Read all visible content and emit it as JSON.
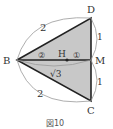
{
  "figure": {
    "caption": "図10",
    "points": {
      "B": {
        "label": "B",
        "x": 17,
        "y": 60
      },
      "D": {
        "label": "D",
        "x": 91,
        "y": 18
      },
      "M": {
        "label": "M",
        "x": 91,
        "y": 60
      },
      "C": {
        "label": "C",
        "x": 91,
        "y": 101
      },
      "H": {
        "label": "H",
        "x": 67,
        "y": 60
      }
    },
    "lengths": {
      "BD": "2",
      "BC": "2",
      "DM": "1",
      "MC": "1",
      "BM": "√3"
    },
    "ratio": {
      "BH": "②",
      "HM": "①"
    },
    "colors": {
      "fill": "#c8c8c8",
      "stroke": "#222222",
      "arc": "#888888"
    }
  }
}
